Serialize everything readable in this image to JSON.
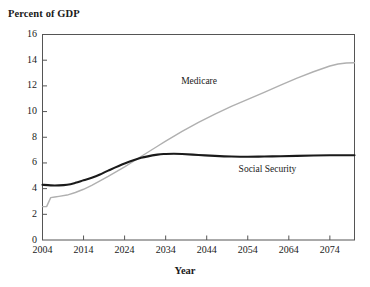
{
  "chart_data": {
    "type": "line",
    "title": "",
    "ylabel": "Percent of GDP",
    "xlabel": "Year",
    "grid": false,
    "legend_position": "inline-annotation",
    "xlim": [
      2004,
      2080
    ],
    "ylim": [
      0,
      16
    ],
    "yticks": [
      0,
      2,
      4,
      6,
      8,
      10,
      12,
      14,
      16
    ],
    "xticks": [
      2004,
      2014,
      2024,
      2034,
      2044,
      2054,
      2064,
      2074
    ],
    "series": [
      {
        "name": "Medicare",
        "color": "#b0b0b0",
        "label_text": "Medicare",
        "x": [
          2004,
          2005,
          2006,
          2007,
          2008,
          2010,
          2012,
          2014,
          2016,
          2018,
          2020,
          2024,
          2028,
          2032,
          2034,
          2038,
          2042,
          2046,
          2050,
          2054,
          2058,
          2062,
          2066,
          2070,
          2074,
          2076,
          2078,
          2080
        ],
        "values": [
          2.6,
          2.6,
          3.3,
          3.35,
          3.4,
          3.5,
          3.7,
          3.95,
          4.25,
          4.6,
          4.95,
          5.7,
          6.5,
          7.3,
          7.7,
          8.45,
          9.15,
          9.8,
          10.4,
          10.95,
          11.5,
          12.05,
          12.6,
          13.1,
          13.55,
          13.7,
          13.78,
          13.8
        ]
      },
      {
        "name": "Social Security",
        "color": "#1a1a1a",
        "label_text": "Social Security",
        "x": [
          2004,
          2006,
          2008,
          2010,
          2012,
          2014,
          2016,
          2018,
          2020,
          2024,
          2028,
          2032,
          2034,
          2036,
          2038,
          2042,
          2046,
          2050,
          2054,
          2058,
          2062,
          2066,
          2070,
          2074,
          2078,
          2080
        ],
        "values": [
          4.3,
          4.25,
          4.25,
          4.3,
          4.45,
          4.65,
          4.85,
          5.1,
          5.4,
          5.95,
          6.4,
          6.65,
          6.7,
          6.72,
          6.7,
          6.62,
          6.55,
          6.5,
          6.48,
          6.5,
          6.52,
          6.55,
          6.58,
          6.6,
          6.6,
          6.6
        ]
      }
    ],
    "annotations": [
      {
        "text": "Medicare",
        "x": 2048,
        "y": 12.3
      },
      {
        "text": "Social Security",
        "x": 2062,
        "y": 5.45
      }
    ]
  },
  "axis": {
    "ytick_labels": [
      "16",
      "14",
      "12",
      "10",
      "8",
      "6",
      "4",
      "2",
      "0"
    ],
    "xtick_labels": [
      "2004",
      "2014",
      "2024",
      "2034",
      "2044",
      "2054",
      "2064",
      "2074"
    ]
  },
  "colors": {
    "frame": "#555555",
    "medicare": "#b0b0b0",
    "social_security": "#1a1a1a",
    "text": "#1a1a1a",
    "background": "#ffffff"
  }
}
